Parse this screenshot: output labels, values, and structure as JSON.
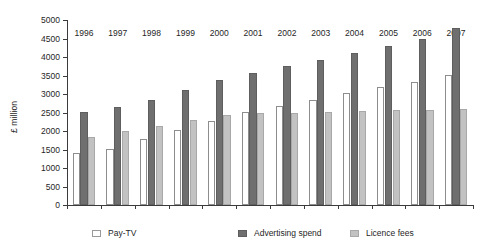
{
  "chart_data": {
    "type": "bar",
    "title": "",
    "xlabel": "",
    "ylabel": "£ million",
    "ylim": [
      0,
      5000
    ],
    "ytick_step": 500,
    "yticks": [
      "0",
      "500",
      "1000",
      "1500",
      "2000",
      "2500",
      "3000",
      "3500",
      "4000",
      "4500",
      "5000"
    ],
    "grid": false,
    "legend_position": "bottom",
    "categories": [
      "1996",
      "1997",
      "1998",
      "1999",
      "2000",
      "2001",
      "2002",
      "2003",
      "2004",
      "2005",
      "2006",
      "2007"
    ],
    "series": [
      {
        "name": "Pay-TV",
        "color": "#ffffff",
        "values": [
          1400,
          1520,
          1790,
          2030,
          2270,
          2520,
          2680,
          2850,
          3020,
          3180,
          3320,
          3520
        ]
      },
      {
        "name": "Advertising spend",
        "color": "#6f6f6f",
        "values": [
          2520,
          2660,
          2850,
          3100,
          3380,
          3560,
          3760,
          3930,
          4100,
          4300,
          4500,
          4780
        ]
      },
      {
        "name": "Licence fees",
        "color": "#c2c2c2",
        "values": [
          1840,
          1990,
          2140,
          2300,
          2440,
          2480,
          2500,
          2520,
          2540,
          2560,
          2580,
          2600
        ]
      }
    ]
  },
  "legend": {
    "items": [
      {
        "label": "Pay-TV",
        "swatch": "paytv"
      },
      {
        "label": "Advertising spend",
        "swatch": "ad"
      },
      {
        "label": "Licence fees",
        "swatch": "lic"
      }
    ]
  },
  "axis": {
    "y_title": "£ million"
  }
}
